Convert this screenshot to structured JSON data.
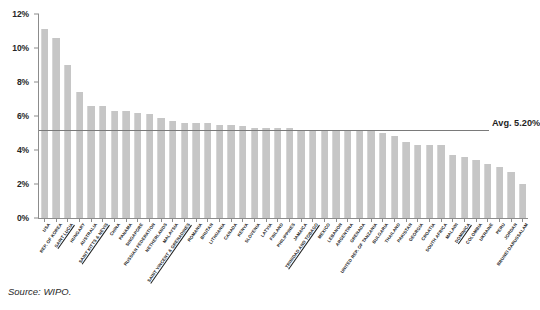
{
  "source_note": "Source: WIPO.",
  "average": {
    "label": "Avg. 5.20%",
    "value": 5.2
  },
  "chart_data": {
    "type": "bar",
    "title": "",
    "subtitle": "",
    "xlabel": "",
    "ylabel": "",
    "ylim": [
      0,
      12
    ],
    "yticks": [
      0,
      2,
      4,
      6,
      8,
      10,
      12
    ],
    "ytick_labels": [
      "0%",
      "2%",
      "4%",
      "6%",
      "8%",
      "10%",
      "12%"
    ],
    "grid": false,
    "legend": "none",
    "annotations": [
      "Avg. 5.20%"
    ],
    "categories": [
      "USA",
      "REP. OF KOREA",
      "SAINT LUCIA",
      "HUNGARY",
      "AUSTRALIA",
      "SAINT KITTS & NEVIS",
      "CHINA",
      "PANAMA",
      "SINGAPORE",
      "RUSSIAN FEDERATION",
      "NETHERLANDS",
      "MALAYSIA",
      "SAINT VINCENT & GRENADINES",
      "ROMANIA",
      "BHUTAN",
      "LITHUANIA",
      "CANADA",
      "KENYA",
      "SLOVENIA",
      "LATVIA",
      "FINLAND",
      "PHILIPPINES",
      "JAMAICA",
      "TRINIDAD AND TOBAGO",
      "MEXICO",
      "LEBANON",
      "ARGENTINA",
      "GRENADA",
      "UNITED REP. OF TANZANIA",
      "BULGARIA",
      "THAILAND",
      "PAKISTAN",
      "GEORGIA",
      "CROATIA",
      "SOUTH AFRICA",
      "MALAWI",
      "DOMINICA",
      "COLOMBIA",
      "UKRAINE",
      "PERU",
      "JORDAN",
      "BRUNEI DARUSSALAM"
    ],
    "values": [
      11.1,
      10.6,
      9.0,
      7.4,
      6.6,
      6.6,
      6.3,
      6.3,
      6.2,
      6.1,
      5.9,
      5.7,
      5.6,
      5.6,
      5.6,
      5.5,
      5.5,
      5.4,
      5.3,
      5.3,
      5.3,
      5.3,
      5.2,
      5.2,
      5.2,
      5.2,
      5.2,
      5.1,
      5.1,
      5.0,
      4.8,
      4.5,
      4.3,
      4.3,
      4.3,
      3.7,
      3.6,
      3.4,
      3.2,
      3.0,
      2.7,
      2.0
    ],
    "underlined_categories": [
      "SAINT LUCIA",
      "SAINT KITTS & NEVIS",
      "SAINT VINCENT & GRENADINES",
      "TRINIDAD AND TOBAGO",
      "DOMINICA"
    ]
  }
}
